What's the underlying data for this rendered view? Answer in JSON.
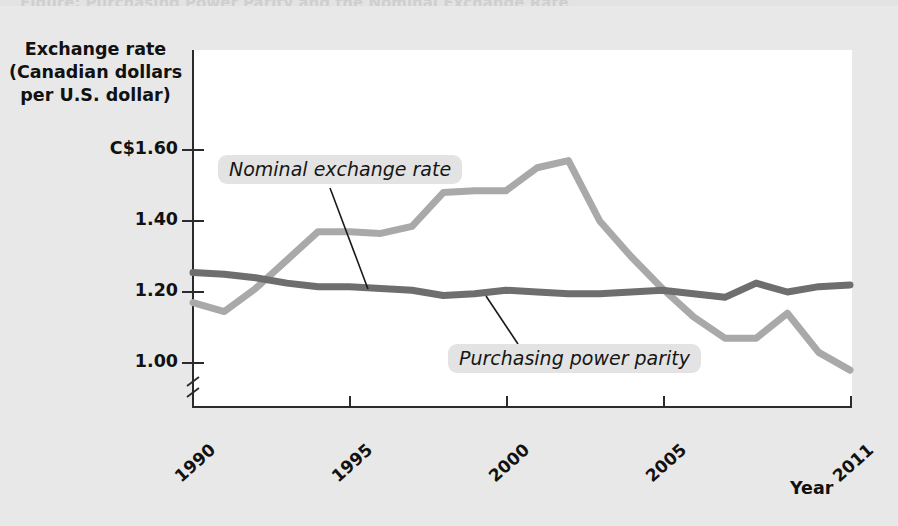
{
  "figure": {
    "cut_title": "Figure: Purchasing Power Parity and the Nominal Exchange Rate",
    "background_color": "#e8e8e8",
    "plot_background_color": "#ffffff"
  },
  "axes": {
    "y_title_line1": "Exchange rate",
    "y_title_line2": "(Canadian dollars",
    "y_title_line3": "per U.S. dollar)",
    "x_title": "Year",
    "y_ticks": [
      "C$1.60",
      "1.40",
      "1.20",
      "1.00"
    ],
    "x_ticks": [
      "1990",
      "1995",
      "2000",
      "2005",
      "2011"
    ],
    "axis_color": "#2b2b2b",
    "has_axis_break": true
  },
  "annotations": [
    {
      "name": "nominal-exchange-rate-label",
      "text": "Nominal exchange rate"
    },
    {
      "name": "purchasing-power-parity-label",
      "text": "Purchasing power parity"
    }
  ],
  "chart_data": {
    "type": "line",
    "title": "Purchasing Power Parity and the Nominal Exchange Rate",
    "xlabel": "Year",
    "ylabel": "Exchange rate (Canadian dollars per U.S. dollar)",
    "xlim": [
      1990,
      2011
    ],
    "ylim": [
      0.93,
      1.66
    ],
    "yticks": [
      1.0,
      1.2,
      1.4,
      1.6
    ],
    "ytick_labels": [
      "1.00",
      "1.20",
      "1.40",
      "C$1.60"
    ],
    "xticks": [
      1990,
      1995,
      2000,
      2005,
      2011
    ],
    "grid": false,
    "axis_break_y": true,
    "legend": "inline annotations",
    "x": [
      1990,
      1991,
      1992,
      1993,
      1994,
      1995,
      1996,
      1997,
      1998,
      1999,
      2000,
      2001,
      2002,
      2003,
      2004,
      2005,
      2006,
      2007,
      2008,
      2009,
      2010,
      2011
    ],
    "series": [
      {
        "name": "Nominal exchange rate",
        "color": "#a9a9a9",
        "values": [
          1.17,
          1.145,
          1.21,
          1.29,
          1.37,
          1.37,
          1.365,
          1.385,
          1.48,
          1.485,
          1.485,
          1.55,
          1.57,
          1.4,
          1.3,
          1.21,
          1.13,
          1.07,
          1.07,
          1.14,
          1.03,
          0.98
        ]
      },
      {
        "name": "Purchasing power parity",
        "color": "#6e6e6e",
        "values": [
          1.255,
          1.25,
          1.24,
          1.225,
          1.215,
          1.215,
          1.21,
          1.205,
          1.19,
          1.195,
          1.205,
          1.2,
          1.195,
          1.195,
          1.2,
          1.205,
          1.195,
          1.185,
          1.225,
          1.2,
          1.215,
          1.22
        ]
      }
    ]
  }
}
